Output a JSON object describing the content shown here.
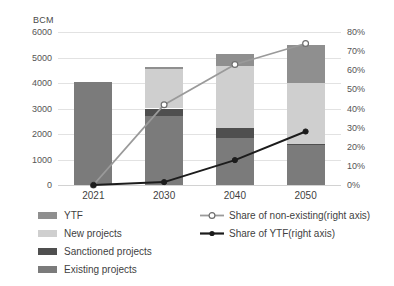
{
  "chart_data": {
    "type": "bar",
    "title": "",
    "subtitle": "",
    "xlabel": "",
    "ylabel": "BCM",
    "y2label": "",
    "categories": [
      "2021",
      "2030",
      "2040",
      "2050"
    ],
    "ylim": [
      0,
      6000
    ],
    "y2lim": [
      0,
      0.8
    ],
    "yticks": [
      "0",
      "1000",
      "2000",
      "3000",
      "4000",
      "5000",
      "6000"
    ],
    "ytick_values": [
      0,
      1000,
      2000,
      3000,
      4000,
      5000,
      6000
    ],
    "y2ticks": [
      "0%",
      "10%",
      "20%",
      "30%",
      "40%",
      "50%",
      "60%",
      "70%",
      "80%"
    ],
    "y2tick_values": [
      0,
      10,
      20,
      30,
      40,
      50,
      60,
      70,
      80
    ],
    "grid": true,
    "legend_position": "bottom",
    "stacked": true,
    "stack_order_bottom_to_top": [
      "Existing projects",
      "Sanctioned projects",
      "New projects",
      "YTF"
    ],
    "series": [
      {
        "name": "Existing projects",
        "kind": "bar",
        "axis": "left",
        "color": "#7b7b7b",
        "values": [
          4050,
          2720,
          1850,
          1560
        ]
      },
      {
        "name": "Sanctioned projects",
        "kind": "bar",
        "axis": "left",
        "color": "#4f4f4f",
        "values": [
          0,
          280,
          380,
          60
        ]
      },
      {
        "name": "New projects",
        "kind": "bar",
        "axis": "left",
        "color": "#cfcfcf",
        "values": [
          0,
          1560,
          2450,
          2380
        ]
      },
      {
        "name": "YTF",
        "kind": "bar",
        "axis": "left",
        "color": "#8f8f8f",
        "values": [
          0,
          50,
          470,
          1490
        ]
      },
      {
        "name": "Share of non-existing(right axis)",
        "kind": "line",
        "axis": "right",
        "color": "#9a9a9a",
        "marker": "open-circle",
        "values": [
          0,
          42,
          63,
          74
        ]
      },
      {
        "name": "Share of YTF(right axis)",
        "kind": "line",
        "axis": "right",
        "color": "#1c1c1c",
        "marker": "filled-circle",
        "values": [
          0,
          1.5,
          13,
          28
        ]
      }
    ]
  },
  "axes": {
    "left_unit_label": "BCM"
  },
  "legend": {
    "bar_items": [
      {
        "label": "YTF",
        "color": "#8f8f8f"
      },
      {
        "label": "New projects",
        "color": "#cfcfcf"
      },
      {
        "label": "Sanctioned projects",
        "color": "#4f4f4f"
      },
      {
        "label": "Existing projects",
        "color": "#7b7b7b"
      }
    ],
    "line_items": [
      {
        "label": "Share of non-existing(right axis)",
        "color": "#9a9a9a",
        "marker": "open-circle"
      },
      {
        "label": "Share of YTF(right axis)",
        "color": "#1c1c1c",
        "marker": "filled-circle"
      }
    ]
  }
}
